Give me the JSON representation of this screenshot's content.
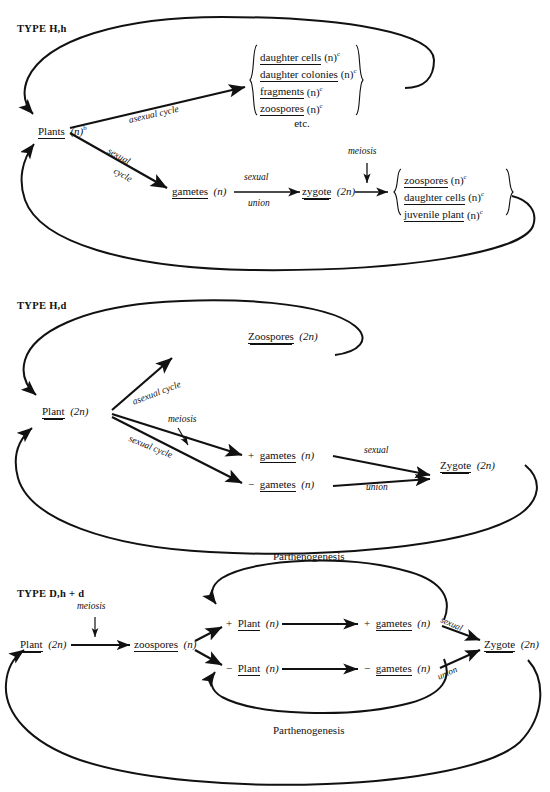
{
  "page": {
    "width": 550,
    "height": 792,
    "background": "#ffffff",
    "ink": "#111111",
    "partial_top_line": "cut-off text line"
  },
  "diagrams": [
    {
      "id": "type-h-h",
      "type_label": "TYPE  H,h",
      "nodes": {
        "plants": {
          "name": "Plants",
          "ploidy": "(n)",
          "superscript": "b",
          "underline": "single"
        },
        "gametes": {
          "name": "gametes",
          "ploidy": "(n)",
          "superscript": "",
          "underline": "single"
        },
        "zygote": {
          "name": "zygote",
          "ploidy": "(2n)",
          "superscript": "",
          "underline": "double"
        }
      },
      "asexual_products": {
        "items": [
          {
            "name": "daughter cells",
            "ploidy": "(n)",
            "superscript": "c",
            "underline": "single"
          },
          {
            "name": "daughter colonies",
            "ploidy": "(n)",
            "superscript": "c",
            "underline": "single"
          },
          {
            "name": "fragments",
            "ploidy": "(n)",
            "superscript": "c",
            "underline": "single"
          },
          {
            "name": "zoospores",
            "ploidy": "(n)",
            "superscript": "c",
            "underline": "single"
          },
          {
            "name": "etc.",
            "ploidy": "",
            "superscript": "",
            "underline": "none"
          }
        ]
      },
      "meiotic_products": {
        "items": [
          {
            "name": "zoospores",
            "ploidy": "(n)",
            "superscript": "c",
            "underline": "single"
          },
          {
            "name": "daughter cells",
            "ploidy": "(n)",
            "superscript": "c",
            "underline": "single"
          },
          {
            "name": "juvenile plant",
            "ploidy": "(n)",
            "superscript": "c",
            "underline": "single"
          }
        ]
      },
      "arrow_labels": {
        "asexual_cycle": "asexual cycle",
        "sexual_line1": "sexual",
        "sexual_line2": "cycle",
        "sexual_union_top": "sexual",
        "sexual_union_bottom": "union",
        "meiosis": "meiosis"
      }
    },
    {
      "id": "type-h-d",
      "type_label": "TYPE  H,d",
      "nodes": {
        "plant": {
          "name": "Plant",
          "ploidy": "(2n)",
          "underline": "double"
        },
        "zoospores": {
          "name": "Zoospores",
          "ploidy": "(2n)",
          "underline": "double"
        },
        "plus_gametes": {
          "sign": "+",
          "name": "gametes",
          "ploidy": "(n)",
          "underline": "single"
        },
        "minus_gametes": {
          "sign": "−",
          "name": "gametes",
          "ploidy": "(n)",
          "underline": "single"
        },
        "zygote": {
          "name": "Zygote",
          "ploidy": "(2n)",
          "underline": "double"
        }
      },
      "arrow_labels": {
        "asexual_cycle": "asexual cycle",
        "sexual_cycle": "sexual cycle",
        "meiosis": "meiosis",
        "sexual": "sexual",
        "union": "union"
      }
    },
    {
      "id": "type-d-h-plus-d",
      "type_label": "TYPE  D,h + d",
      "nodes": {
        "plant": {
          "name": "Plant",
          "ploidy": "(2n)",
          "underline": "double"
        },
        "zoospores": {
          "name": "zoospores",
          "ploidy": "(n)",
          "underline": "single"
        },
        "plus_plant": {
          "sign": "+",
          "name": "Plant",
          "ploidy": "(n)",
          "underline": "single"
        },
        "minus_plant": {
          "sign": "−",
          "name": "Plant",
          "ploidy": "(n)",
          "underline": "single"
        },
        "plus_gametes": {
          "sign": "+",
          "name": "gametes",
          "ploidy": "(n)",
          "underline": "single"
        },
        "minus_gametes": {
          "sign": "−",
          "name": "gametes",
          "ploidy": "(n)",
          "underline": "single"
        },
        "zygote": {
          "name": "Zygote",
          "ploidy": "(2n)",
          "underline": "double"
        }
      },
      "arrow_labels": {
        "meiosis": "meiosis",
        "parthenogenesis_top": "Parthenogenesis",
        "parthenogenesis_bottom": "Parthenogenesis",
        "sexual": "sexual",
        "union": "union"
      }
    }
  ]
}
